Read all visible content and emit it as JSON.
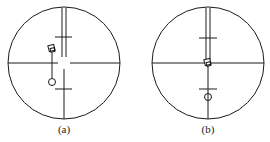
{
  "figure": {
    "panels": [
      {
        "id": "a",
        "label": "(a)",
        "description": "Reticle view with target offset left of vertical crosshair",
        "target_aligned": false
      },
      {
        "id": "b",
        "label": "(b)",
        "description": "Reticle view with target centered on crosshair intersection",
        "target_aligned": true
      }
    ],
    "colors": {
      "line": "#1a1a1a",
      "background": "#ffffff"
    }
  }
}
